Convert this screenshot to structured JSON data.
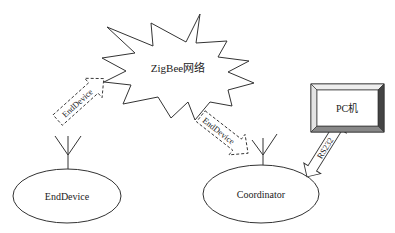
{
  "diagram": {
    "network_label": "ZigBee网络",
    "end_device_node_label": "EndDevice",
    "coordinator_node_label": "Coordinator",
    "pc_label": "PC机",
    "arrows": [
      {
        "label": "EndDevice",
        "from": "EndDevice",
        "to": "ZigBee网络",
        "style": "dashed"
      },
      {
        "label": "EndDevice",
        "from": "ZigBee网络",
        "to": "Coordinator",
        "style": "dashed"
      },
      {
        "label": "RS232",
        "from": "Coordinator",
        "to": "PC机",
        "style": "solid-double"
      }
    ]
  },
  "colors": {
    "stroke": "#333333",
    "background": "#ffffff",
    "pc_bevel_dark": "#444444",
    "pc_bevel_mid": "#888888",
    "pc_bevel_light": "#dddddd"
  }
}
